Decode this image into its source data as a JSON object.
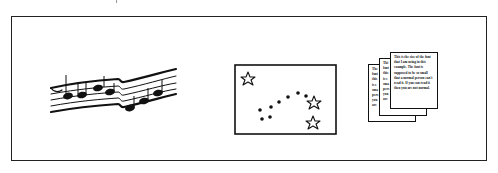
{
  "figure": {
    "panels": [
      {
        "id": "music",
        "icon": "music-staff-icon",
        "description": "Wavy musical staff with notes"
      },
      {
        "id": "stars",
        "icon": "star-chart-icon",
        "description": "Framed picture with stars and a dotted arc"
      },
      {
        "id": "documents",
        "icon": "stacked-documents-icon",
        "description": "Three overlapping pages of text"
      }
    ],
    "document_text": "This is the size of the font that I am using in this example. The font is supposed to be so small that a normal person can't read it. If you can read it then you are not normal.",
    "back_page_fragments": [
      "The",
      "font",
      "this",
      "is s",
      "sma",
      "pers",
      "you",
      "are"
    ],
    "middle_page_fragments": [
      "Thi",
      "font",
      "this",
      "is s",
      "sma",
      "pers",
      "you",
      "are"
    ],
    "colors": {
      "ink": "#111111",
      "background": "#ffffff",
      "frame": "#222222"
    }
  }
}
